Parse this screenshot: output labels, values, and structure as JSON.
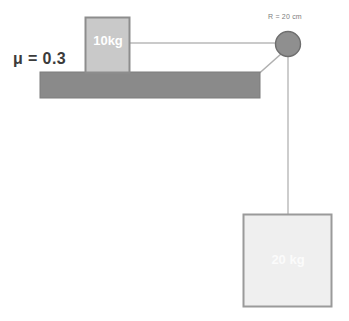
{
  "diagram": {
    "background_color": "#ffffff",
    "friction": {
      "label": "μ = 0.3",
      "color": "#3b3b3b"
    },
    "pulley": {
      "radius_label": "R = 20 cm",
      "fill_color": "#8f8f8f",
      "stroke_color": "#6e6e6e",
      "center_x": 288,
      "center_y": 44,
      "radius": 12.5
    },
    "table": {
      "name": "horizontal-surface",
      "fill_color": "#8a8a8a",
      "stroke_color": "#787878",
      "x": 40,
      "y": 72,
      "width": 220,
      "height": 26
    },
    "block_on_table": {
      "label": "10kg",
      "mass_value": 10,
      "mass_unit": "kg",
      "fill_color": "#c9c9c9",
      "stroke_color": "#8d8d8d",
      "text_color": "#ffffff",
      "x": 85,
      "y": 17,
      "width": 45,
      "height": 55
    },
    "hanging_block": {
      "label": "20 kg",
      "mass_value": 20,
      "mass_unit": "kg",
      "fill_color": "#eeeeee",
      "stroke_color": "#9a9a9a",
      "text_color": "#fbfbfb",
      "x": 243,
      "y": 214,
      "width": 89,
      "height": 93
    },
    "ropes": {
      "color": "#b4b4b4",
      "horizontal": {
        "x1": 130,
        "y1": 43,
        "x2": 276,
        "y2": 43
      },
      "diagonal": {
        "x1": 260,
        "y1": 73,
        "x2": 281,
        "y2": 54
      },
      "vertical": {
        "x1": 288,
        "y1": 57,
        "x2": 288,
        "y2": 214
      }
    }
  }
}
